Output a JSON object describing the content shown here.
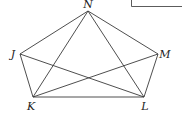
{
  "diagram": {
    "type": "graph",
    "vertices": [
      {
        "id": "N",
        "label": "N",
        "x": 88,
        "y": 11,
        "label_x": 88,
        "label_y": 8,
        "anchor": "middle"
      },
      {
        "id": "J",
        "label": "J",
        "x": 20,
        "y": 54,
        "label_x": 13,
        "label_y": 58,
        "anchor": "middle"
      },
      {
        "id": "M",
        "label": "M",
        "x": 158,
        "y": 54,
        "label_x": 165,
        "label_y": 58,
        "anchor": "middle"
      },
      {
        "id": "K",
        "label": "K",
        "x": 33,
        "y": 97,
        "label_x": 31,
        "label_y": 110,
        "anchor": "middle"
      },
      {
        "id": "L",
        "label": "L",
        "x": 144,
        "y": 97,
        "label_x": 145,
        "label_y": 110,
        "anchor": "middle"
      }
    ],
    "edges": [
      [
        "N",
        "J"
      ],
      [
        "N",
        "K"
      ],
      [
        "N",
        "L"
      ],
      [
        "N",
        "M"
      ],
      [
        "J",
        "K"
      ],
      [
        "J",
        "L"
      ],
      [
        "M",
        "K"
      ],
      [
        "M",
        "L"
      ],
      [
        "K",
        "L"
      ]
    ],
    "colors": {
      "line": "#3a3a3a",
      "label": "#222222",
      "background": "#ffffff"
    }
  }
}
